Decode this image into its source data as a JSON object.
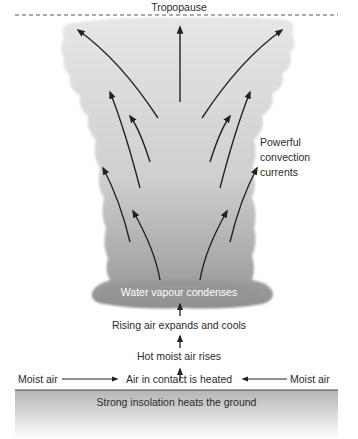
{
  "diagram": {
    "title_top": "Tropopause",
    "side_label": [
      "Powerful",
      "convection",
      "currents"
    ],
    "cloud_base_label": "Water vapour condenses",
    "steps": [
      "Rising air expands and cools",
      "Hot moist air rises",
      "Air in contact is heated"
    ],
    "inflow_left": "Moist air",
    "inflow_right": "Moist air",
    "ground_label": "Strong insolation heats the ground"
  },
  "colors": {
    "cloud_light": "#e4e4e4",
    "cloud_dark": "#9a9a9a",
    "arrow": "#222222",
    "ground_top": "#b9b9b9",
    "ground_bottom": "#ffffff",
    "text": "#2b2b2b"
  }
}
